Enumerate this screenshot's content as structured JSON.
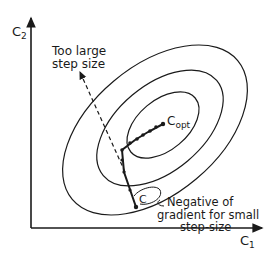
{
  "figure": {
    "axes": {
      "x_label": "C",
      "x_sub": "1",
      "y_label": "C",
      "y_sub": "2"
    },
    "annotations": {
      "too_large_line1": "Too large",
      "too_large_line2": "step size",
      "optimum_label": "C",
      "optimum_sub": "opt",
      "start_label": "C",
      "gradient_line1": "Negative of",
      "gradient_line2": "gradient for small",
      "gradient_line3": "step-size"
    },
    "colors": {
      "ink": "#1a1a1a",
      "background": "#ffffff"
    }
  }
}
